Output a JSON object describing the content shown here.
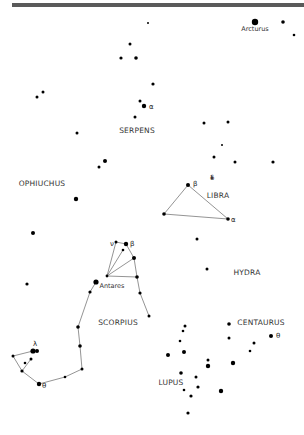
{
  "map": {
    "type": "star-chart",
    "width": 304,
    "height": 435,
    "colors": {
      "background": "#ffffff",
      "star": "#000000",
      "line": "#888888",
      "label": "#333333",
      "topbar": "#5a5a5a"
    },
    "constellations": [
      {
        "name": "SERPENS",
        "x": 137,
        "y": 133
      },
      {
        "name": "OPHIUCHUS",
        "x": 42,
        "y": 186
      },
      {
        "name": "LIBRA",
        "x": 218,
        "y": 198
      },
      {
        "name": "HYDRA",
        "x": 247,
        "y": 275
      },
      {
        "name": "SCORPIUS",
        "x": 118,
        "y": 325
      },
      {
        "name": "CENTAURUS",
        "x": 261,
        "y": 325
      },
      {
        "name": "LUPUS",
        "x": 171,
        "y": 385
      }
    ],
    "star_names": [
      {
        "name": "Arcturus",
        "x": 255,
        "y": 31
      },
      {
        "name": "Antares",
        "x": 112,
        "y": 288
      }
    ],
    "greek_labels": [
      {
        "text": "α",
        "x": 149,
        "y": 109
      },
      {
        "text": "δ",
        "x": 210,
        "y": 180
      },
      {
        "text": "β",
        "x": 193,
        "y": 186
      },
      {
        "text": "α",
        "x": 231,
        "y": 222
      },
      {
        "text": "ν",
        "x": 110,
        "y": 246
      },
      {
        "text": "β",
        "x": 130,
        "y": 246
      },
      {
        "text": "λ",
        "x": 33,
        "y": 346
      },
      {
        "text": "θ",
        "x": 42,
        "y": 388
      },
      {
        "text": "θ",
        "x": 276,
        "y": 338
      }
    ],
    "stars": [
      {
        "x": 255,
        "y": 22,
        "r": 3.2
      },
      {
        "x": 283,
        "y": 22,
        "r": 1.8
      },
      {
        "x": 294,
        "y": 35,
        "r": 1.3
      },
      {
        "x": 148,
        "y": 23,
        "r": 1.0
      },
      {
        "x": 130,
        "y": 44,
        "r": 1.5
      },
      {
        "x": 121,
        "y": 58,
        "r": 1.6
      },
      {
        "x": 136,
        "y": 58,
        "r": 1.8
      },
      {
        "x": 153,
        "y": 84,
        "r": 1.6
      },
      {
        "x": 140,
        "y": 101,
        "r": 1.5
      },
      {
        "x": 144,
        "y": 106,
        "r": 2.2
      },
      {
        "x": 135,
        "y": 117,
        "r": 1.5
      },
      {
        "x": 43,
        "y": 92,
        "r": 1.5
      },
      {
        "x": 37,
        "y": 97,
        "r": 1.5
      },
      {
        "x": 77,
        "y": 133,
        "r": 1.5
      },
      {
        "x": 204,
        "y": 123,
        "r": 1.5
      },
      {
        "x": 228,
        "y": 122,
        "r": 1.5
      },
      {
        "x": 222,
        "y": 145,
        "r": 1.0
      },
      {
        "x": 214,
        "y": 157,
        "r": 1.5
      },
      {
        "x": 235,
        "y": 162,
        "r": 1.5
      },
      {
        "x": 273,
        "y": 162,
        "r": 1.6
      },
      {
        "x": 212,
        "y": 178,
        "r": 1.0
      },
      {
        "x": 105,
        "y": 161,
        "r": 2.0
      },
      {
        "x": 99,
        "y": 167,
        "r": 1.5
      },
      {
        "x": 76,
        "y": 199,
        "r": 2.2
      },
      {
        "x": 188,
        "y": 185,
        "r": 2.0
      },
      {
        "x": 164,
        "y": 214,
        "r": 1.8
      },
      {
        "x": 228,
        "y": 219,
        "r": 1.8
      },
      {
        "x": 197,
        "y": 239,
        "r": 1.5
      },
      {
        "x": 33,
        "y": 233,
        "r": 2.0
      },
      {
        "x": 27,
        "y": 284,
        "r": 1.6
      },
      {
        "x": 116,
        "y": 242,
        "r": 1.5
      },
      {
        "x": 126,
        "y": 244,
        "r": 2.2
      },
      {
        "x": 123,
        "y": 250,
        "r": 1.3
      },
      {
        "x": 134,
        "y": 258,
        "r": 2.0
      },
      {
        "x": 107,
        "y": 276,
        "r": 1.4
      },
      {
        "x": 96,
        "y": 282,
        "r": 2.6
      },
      {
        "x": 137,
        "y": 277,
        "r": 1.8
      },
      {
        "x": 90,
        "y": 292,
        "r": 1.6
      },
      {
        "x": 140,
        "y": 293,
        "r": 1.6
      },
      {
        "x": 149,
        "y": 316,
        "r": 1.5
      },
      {
        "x": 78,
        "y": 327,
        "r": 1.8
      },
      {
        "x": 80,
        "y": 346,
        "r": 1.8
      },
      {
        "x": 82,
        "y": 369,
        "r": 1.5
      },
      {
        "x": 65,
        "y": 377,
        "r": 1.3
      },
      {
        "x": 39,
        "y": 384,
        "r": 2.2
      },
      {
        "x": 22,
        "y": 371,
        "r": 1.6
      },
      {
        "x": 25,
        "y": 363,
        "r": 1.3
      },
      {
        "x": 31,
        "y": 359,
        "r": 1.5
      },
      {
        "x": 13,
        "y": 356,
        "r": 1.5
      },
      {
        "x": 33,
        "y": 351,
        "r": 2.6
      },
      {
        "x": 37,
        "y": 351,
        "r": 2.0
      },
      {
        "x": 207,
        "y": 269,
        "r": 1.5
      },
      {
        "x": 185,
        "y": 326,
        "r": 1.5
      },
      {
        "x": 183,
        "y": 331,
        "r": 1.3
      },
      {
        "x": 229,
        "y": 324,
        "r": 1.8
      },
      {
        "x": 229,
        "y": 338,
        "r": 1.5
      },
      {
        "x": 271,
        "y": 336,
        "r": 2.0
      },
      {
        "x": 254,
        "y": 343,
        "r": 1.5
      },
      {
        "x": 250,
        "y": 351,
        "r": 1.3
      },
      {
        "x": 180,
        "y": 341,
        "r": 1.3
      },
      {
        "x": 184,
        "y": 352,
        "r": 2.0
      },
      {
        "x": 168,
        "y": 355,
        "r": 2.0
      },
      {
        "x": 208,
        "y": 360,
        "r": 1.5
      },
      {
        "x": 208,
        "y": 366,
        "r": 2.2
      },
      {
        "x": 233,
        "y": 363,
        "r": 2.2
      },
      {
        "x": 181,
        "y": 373,
        "r": 1.8
      },
      {
        "x": 196,
        "y": 377,
        "r": 1.5
      },
      {
        "x": 198,
        "y": 387,
        "r": 1.6
      },
      {
        "x": 184,
        "y": 390,
        "r": 1.3
      },
      {
        "x": 191,
        "y": 396,
        "r": 1.6
      },
      {
        "x": 221,
        "y": 391,
        "r": 2.2
      },
      {
        "x": 188,
        "y": 413,
        "r": 1.6
      }
    ],
    "lines": [
      [
        [
          188,
          185
        ],
        [
          164,
          214
        ],
        [
          228,
          219
        ],
        [
          188,
          185
        ]
      ],
      [
        [
          116,
          242
        ],
        [
          126,
          244
        ]
      ],
      [
        [
          126,
          244
        ],
        [
          134,
          258
        ],
        [
          137,
          277
        ]
      ],
      [
        [
          107,
          276
        ],
        [
          116,
          242
        ]
      ],
      [
        [
          107,
          276
        ],
        [
          123,
          250
        ]
      ],
      [
        [
          107,
          276
        ],
        [
          134,
          258
        ]
      ],
      [
        [
          107,
          276
        ],
        [
          137,
          277
        ]
      ],
      [
        [
          137,
          277
        ],
        [
          140,
          293
        ],
        [
          149,
          316
        ]
      ],
      [
        [
          96,
          282
        ],
        [
          90,
          292
        ],
        [
          78,
          327
        ],
        [
          80,
          346
        ],
        [
          82,
          369
        ],
        [
          65,
          377
        ],
        [
          39,
          384
        ],
        [
          22,
          371
        ],
        [
          13,
          356
        ],
        [
          33,
          351
        ]
      ],
      [
        [
          22,
          371
        ],
        [
          31,
          359
        ]
      ]
    ]
  }
}
